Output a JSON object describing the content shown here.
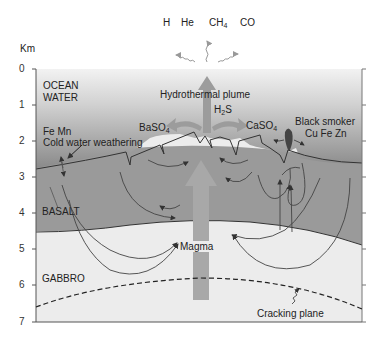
{
  "diagram": {
    "axis": {
      "unit": "Km",
      "ticks": [
        "0",
        "1",
        "2",
        "3",
        "4",
        "5",
        "6",
        "7"
      ]
    },
    "gases": {
      "h": "H",
      "he": "He",
      "ch4_main": "CH",
      "ch4_sub": "4",
      "co": "CO"
    },
    "layers": {
      "ocean_line1": "OCEAN",
      "ocean_line2": "WATER",
      "basalt": "BASALT",
      "gabbro": "GABBRO"
    },
    "labels": {
      "plume": "Hydrothermal plume",
      "h2s_h": "H",
      "h2s_sub": "2",
      "h2s_s": "S",
      "baso4_main": "BaSO",
      "baso4_sub": "4",
      "caso4_main": "CaSO",
      "caso4_sub": "4",
      "fe_mn": "Fe   Mn",
      "cold_water": "Cold water weathering",
      "black_smoker": "Black smoker",
      "cu_fe_zn": "Cu Fe Zn",
      "magma": "Magma",
      "cracking_plane": "Cracking plane"
    },
    "colors": {
      "ocean_top": "#f0f0f0",
      "ocean_bottom": "#8c8c8c",
      "basalt": "#999999",
      "gabbro": "#ececec",
      "arrow": "#9a9a9a",
      "line": "#333333"
    }
  }
}
